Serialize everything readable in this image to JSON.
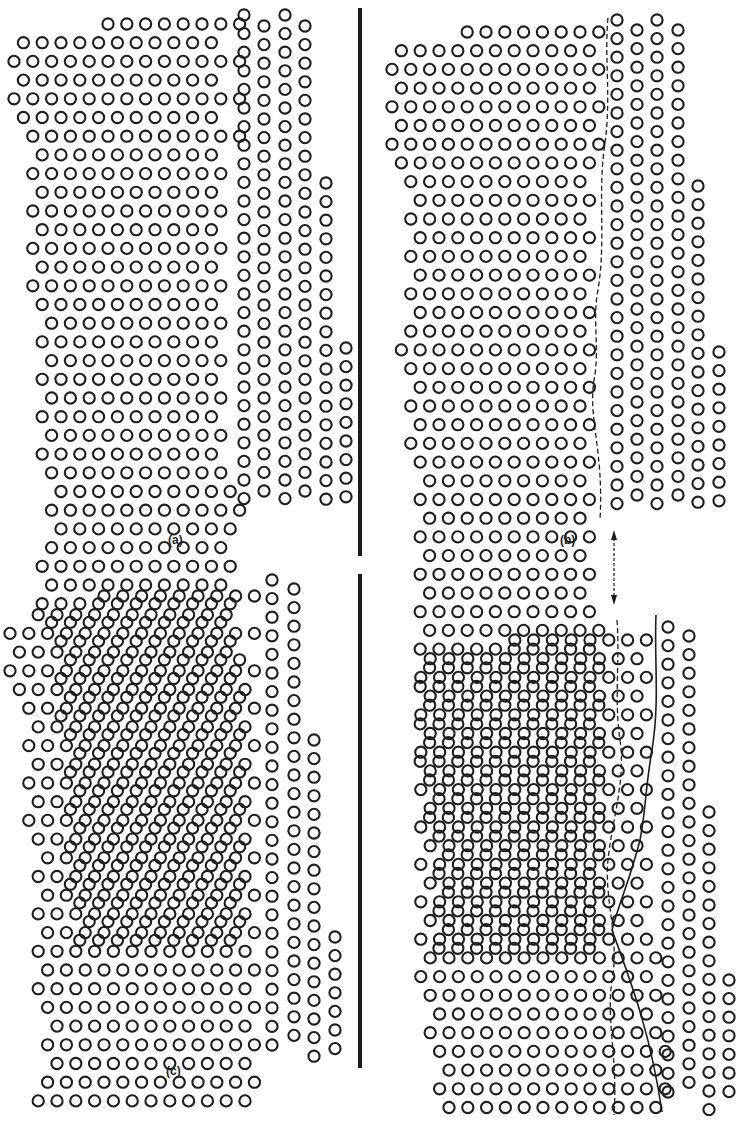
{
  "figure": {
    "colors": {
      "ink": "#1e1e1e",
      "background": "#ffffff"
    },
    "panels": [
      {
        "id": "a",
        "label": "(a)",
        "label_pos": [
          178,
          543
        ],
        "left_grain": {
          "x0": 14,
          "y0": 24,
          "dx": 18.8,
          "dy": 9.35,
          "rows": 50,
          "row_extents": [
            [
              95,
              240
            ],
            [
              22,
              225
            ],
            [
              14,
              240
            ],
            [
              22,
              225
            ],
            [
              14,
              240
            ],
            [
              22,
              225
            ],
            [
              16,
              240
            ],
            [
              24,
              224
            ],
            [
              20,
              238
            ],
            [
              28,
              226
            ],
            [
              22,
              238
            ],
            [
              30,
              218
            ],
            [
              26,
              238
            ],
            [
              36,
              212
            ],
            [
              30,
              222
            ],
            [
              40,
              212
            ],
            [
              34,
              222
            ],
            [
              30,
              226
            ],
            [
              36,
              230
            ],
            [
              26,
              222
            ],
            [
              38,
              230
            ],
            [
              32,
              222
            ],
            [
              36,
              238
            ],
            [
              42,
              228
            ],
            [
              36,
              238
            ],
            [
              46,
              232
            ],
            [
              42,
              240
            ],
            [
              52,
              240
            ],
            [
              46,
              238
            ],
            [
              42,
              240
            ],
            [
              48,
              236
            ],
            [
              40,
              240
            ],
            [
              48,
              238
            ],
            [
              44,
              240
            ],
            [
              56,
              240
            ],
            [
              52,
              240
            ],
            [
              60,
              240
            ],
            [
              56,
              240
            ],
            [
              64,
              240
            ],
            [
              70,
              240
            ],
            [
              64,
              240
            ],
            [
              70,
              240
            ],
            [
              64,
              240
            ],
            [
              72,
              240
            ],
            [
              68,
              240
            ],
            [
              74,
              240
            ],
            [
              68,
              240
            ],
            [
              78,
              240
            ],
            [
              72,
              240
            ],
            [
              70,
              240
            ]
          ]
        },
        "right_grain": {
          "columns": [
            {
              "x": 244,
              "y0": 15,
              "y1": 510,
              "dy": 18.6
            },
            {
              "x": 264,
              "y0": 26,
              "y1": 500,
              "dy": 18.6
            },
            {
              "x": 285,
              "y0": 15,
              "y1": 510,
              "dy": 18.6
            },
            {
              "x": 305,
              "y0": 26,
              "y1": 500,
              "dy": 18.6
            },
            {
              "x": 326,
              "y0": 183,
              "y1": 500,
              "dy": 18.6
            },
            {
              "x": 346,
              "y0": 348,
              "y1": 505,
              "dy": 18.6
            }
          ]
        }
      },
      {
        "id": "b",
        "label": "(b)",
        "label_pos": [
          570,
          543
        ],
        "left_grain": {
          "x0": 392,
          "y0": 32,
          "dx": 18.8,
          "dy": 9.35,
          "rows": 50,
          "row_extents": [
            [
              466,
              600
            ],
            [
              398,
              596
            ],
            [
              392,
              600
            ],
            [
              398,
              596
            ],
            [
              390,
              600
            ],
            [
              398,
              596
            ],
            [
              392,
              600
            ],
            [
              400,
              596
            ],
            [
              396,
              598
            ],
            [
              402,
              596
            ],
            [
              398,
              598
            ],
            [
              404,
              590
            ],
            [
              400,
              598
            ],
            [
              408,
              590
            ],
            [
              402,
              596
            ],
            [
              410,
              592
            ],
            [
              404,
              596
            ],
            [
              400,
              590
            ],
            [
              406,
              598
            ],
            [
              402,
              590
            ],
            [
              408,
              598
            ],
            [
              404,
              590
            ],
            [
              410,
              598
            ],
            [
              406,
              596
            ],
            [
              412,
              598
            ],
            [
              408,
              596
            ],
            [
              414,
              598
            ],
            [
              410,
              596
            ],
            [
              416,
              598
            ],
            [
              412,
              596
            ],
            [
              418,
              598
            ],
            [
              410,
              596
            ],
            [
              418,
              600
            ],
            [
              412,
              598
            ],
            [
              420,
              600
            ],
            [
              414,
              598
            ],
            [
              422,
              600
            ],
            [
              418,
              598
            ],
            [
              424,
              600
            ],
            [
              420,
              598
            ],
            [
              426,
              600
            ],
            [
              422,
              598
            ],
            [
              428,
              600
            ],
            [
              424,
              598
            ],
            [
              430,
              600
            ],
            [
              426,
              598
            ],
            [
              432,
              600
            ],
            [
              428,
              598
            ],
            [
              436,
              600
            ],
            [
              432,
              600
            ]
          ]
        },
        "right_grain": {
          "columns": [
            {
              "x": 617,
              "y0": 20,
              "y1": 510,
              "dy": 18.6
            },
            {
              "x": 637,
              "y0": 30,
              "y1": 500,
              "dy": 18.6
            },
            {
              "x": 657,
              "y0": 20,
              "y1": 510,
              "dy": 18.6
            },
            {
              "x": 678,
              "y0": 30,
              "y1": 500,
              "dy": 18.6
            },
            {
              "x": 698,
              "y0": 186,
              "y1": 510,
              "dy": 18.6
            },
            {
              "x": 719,
              "y0": 352,
              "y1": 505,
              "dy": 18.6
            }
          ]
        },
        "boundaries": [
          {
            "style": "dashed",
            "d": "M608,18 C604,60 612,100 604,150 C598,200 606,240 598,290 C592,320 600,350 594,380 C588,420 604,450 600,520"
          }
        ]
      },
      {
        "id": "c",
        "label": "(c)",
        "label_pos": [
          176,
          1074
        ],
        "left_grain": {
          "x0": 10,
          "y0": 596,
          "dx": 18.8,
          "dy": 9.35,
          "rows": 50,
          "row_extents": [
            [
              104,
              260
            ],
            [
              20,
              245
            ],
            [
              10,
              262
            ],
            [
              18,
              245
            ],
            [
              10,
              262
            ],
            [
              18,
              248
            ],
            [
              14,
              262
            ],
            [
              22,
              250
            ],
            [
              18,
              262
            ],
            [
              26,
              250
            ],
            [
              20,
              262
            ],
            [
              30,
              248
            ],
            [
              24,
              262
            ],
            [
              34,
              250
            ],
            [
              30,
              262
            ],
            [
              38,
              250
            ],
            [
              34,
              262
            ],
            [
              30,
              250
            ],
            [
              36,
              262
            ],
            [
              28,
              250
            ],
            [
              38,
              262
            ],
            [
              32,
              252
            ],
            [
              36,
              262
            ],
            [
              42,
              252
            ],
            [
              36,
              262
            ],
            [
              46,
              256
            ],
            [
              42,
              266
            ],
            [
              38,
              258
            ],
            [
              44,
              262
            ],
            [
              40,
              262
            ],
            [
              46,
              266
            ],
            [
              38,
              262
            ],
            [
              46,
              266
            ],
            [
              42,
              266
            ],
            [
              54,
              270
            ],
            [
              48,
              266
            ],
            [
              56,
              270
            ],
            [
              48,
              270
            ],
            [
              56,
              272
            ],
            [
              60,
              272
            ],
            [
              54,
              272
            ],
            [
              60,
              272
            ],
            [
              56,
              274
            ],
            [
              62,
              274
            ],
            [
              58,
              274
            ],
            [
              64,
              274
            ],
            [
              58,
              274
            ],
            [
              66,
              274
            ],
            [
              62,
              274
            ],
            [
              60,
              274
            ]
          ]
        },
        "right_grain": {
          "columns": [
            {
              "x": 272,
              "y0": 580,
              "y1": 1060,
              "dy": 18.6
            },
            {
              "x": 294,
              "y0": 589,
              "y1": 1052,
              "dy": 18.6
            },
            {
              "x": 314,
              "y0": 740,
              "y1": 1060,
              "dy": 18.6
            },
            {
              "x": 335,
              "y0": 937,
              "y1": 1060,
              "dy": 18.6
            }
          ]
        }
      },
      {
        "id": "d",
        "label": "",
        "label_pos": [
          0,
          0
        ],
        "left_grain": {
          "x0": 402,
          "y0": 640,
          "dx": 18.8,
          "dy": 9.35,
          "rows": 48,
          "row_extents": [
            [
              500,
              650
            ],
            [
              414,
              640
            ],
            [
              406,
              650
            ],
            [
              414,
              640
            ],
            [
              404,
              650
            ],
            [
              412,
              640
            ],
            [
              408,
              648
            ],
            [
              416,
              640
            ],
            [
              410,
              648
            ],
            [
              418,
              644
            ],
            [
              414,
              650
            ],
            [
              420,
              646
            ],
            [
              414,
              654
            ],
            [
              422,
              650
            ],
            [
              418,
              656
            ],
            [
              424,
              652
            ],
            [
              418,
              658
            ],
            [
              426,
              656
            ],
            [
              420,
              660
            ],
            [
              428,
              660
            ],
            [
              422,
              664
            ],
            [
              430,
              664
            ],
            [
              424,
              668
            ],
            [
              432,
              668
            ],
            [
              426,
              670
            ],
            [
              432,
              672
            ],
            [
              428,
              674
            ],
            [
              434,
              676
            ],
            [
              430,
              678
            ],
            [
              436,
              680
            ],
            [
              432,
              682
            ],
            [
              438,
              684
            ],
            [
              432,
              686
            ],
            [
              440,
              686
            ],
            [
              436,
              688
            ],
            [
              442,
              690
            ],
            [
              436,
              692
            ],
            [
              444,
              692
            ],
            [
              440,
              694
            ],
            [
              446,
              694
            ],
            [
              440,
              696
            ],
            [
              448,
              698
            ],
            [
              444,
              700
            ],
            [
              450,
              700
            ],
            [
              446,
              702
            ],
            [
              452,
              704
            ],
            [
              448,
              706
            ],
            [
              454,
              708
            ]
          ]
        },
        "right_grain": {
          "columns": [
            {
              "x": 668,
              "y0": 627,
              "y1": 1110,
              "dy": 18.6
            },
            {
              "x": 689,
              "y0": 636,
              "y1": 1100,
              "dy": 18.6
            },
            {
              "x": 709,
              "y0": 812,
              "y1": 1110,
              "dy": 18.6
            },
            {
              "x": 729,
              "y0": 980,
              "y1": 1100,
              "dy": 18.6
            }
          ]
        },
        "boundaries": [
          {
            "style": "dashed",
            "d": "M617,620 C620,660 614,700 620,740 C626,780 612,820 608,860 C604,900 620,940 612,980 C606,1020 618,1060 614,1115"
          },
          {
            "style": "solid",
            "d": "M656,615 C654,660 660,700 652,750 C645,790 646,810 640,840 C630,880 620,900 612,930 C630,980 650,1030 662,1112"
          }
        ]
      }
    ],
    "dividers": [
      {
        "x": 358,
        "y0": 8,
        "y1": 556
      },
      {
        "x": 358,
        "y0": 574,
        "y1": 1068
      }
    ],
    "arrow": {
      "x": 614,
      "y0": 530,
      "y1": 605,
      "description": "double-headed dashed arrow linking panels (b) and (d)"
    },
    "caption_fragment": ""
  }
}
